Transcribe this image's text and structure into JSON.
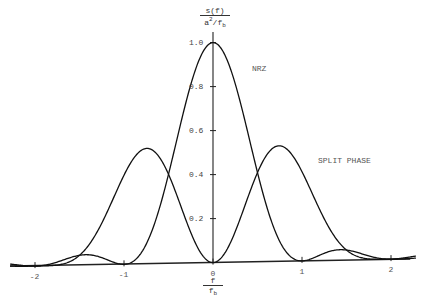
{
  "chart_data": {
    "type": "line",
    "title": "",
    "ylabel": {
      "numerator": "s(f)",
      "denominator_base": "a",
      "denominator_sup": "2",
      "denominator_rest": "/f",
      "denominator_sub": "b"
    },
    "xlabel": {
      "numerator": "f",
      "denominator_base": "f",
      "denominator_sub": "b"
    },
    "x_ticks": [
      "-2",
      "-1",
      "0",
      "1",
      "2"
    ],
    "y_ticks": [
      "0.2",
      "0.4",
      "0.6",
      "0.8",
      "1.0"
    ],
    "xlim": [
      -2.3,
      2.3
    ],
    "ylim": [
      0,
      1.0
    ],
    "grid": false,
    "series": [
      {
        "name": "NRZ",
        "formula": "sinc^2(f/fb)",
        "x": [
          -2.0,
          -1.75,
          -1.5,
          -1.25,
          -1.0,
          -0.75,
          -0.5,
          -0.25,
          0.0,
          0.25,
          0.5,
          0.75,
          1.0,
          1.25,
          1.5,
          1.75,
          2.0
        ],
        "values": [
          0.0,
          0.03,
          0.045,
          0.026,
          0.0,
          0.09,
          0.405,
          0.811,
          1.0,
          0.811,
          0.405,
          0.09,
          0.0,
          0.026,
          0.045,
          0.03,
          0.0
        ]
      },
      {
        "name": "SPLIT PHASE",
        "formula": "sin^4(pi f/2fb)/(pi f/2fb)^2",
        "x": [
          -2.0,
          -1.75,
          -1.5,
          -1.25,
          -1.0,
          -0.75,
          -0.5,
          -0.25,
          0.0,
          0.25,
          0.5,
          0.75,
          1.0,
          1.25,
          1.5,
          1.75,
          2.0
        ],
        "values": [
          0.0,
          0.017,
          0.065,
          0.173,
          0.405,
          0.51,
          0.405,
          0.138,
          0.0,
          0.138,
          0.405,
          0.51,
          0.405,
          0.173,
          0.065,
          0.017,
          0.0
        ]
      }
    ],
    "annotations": [
      {
        "text": "NRZ",
        "x": 0.45,
        "y": 0.91
      },
      {
        "text": "SPLIT PHASE",
        "x": 1.15,
        "y": 0.45
      }
    ]
  },
  "labels": {
    "nrz": "NRZ",
    "split_phase": "SPLIT PHASE"
  }
}
